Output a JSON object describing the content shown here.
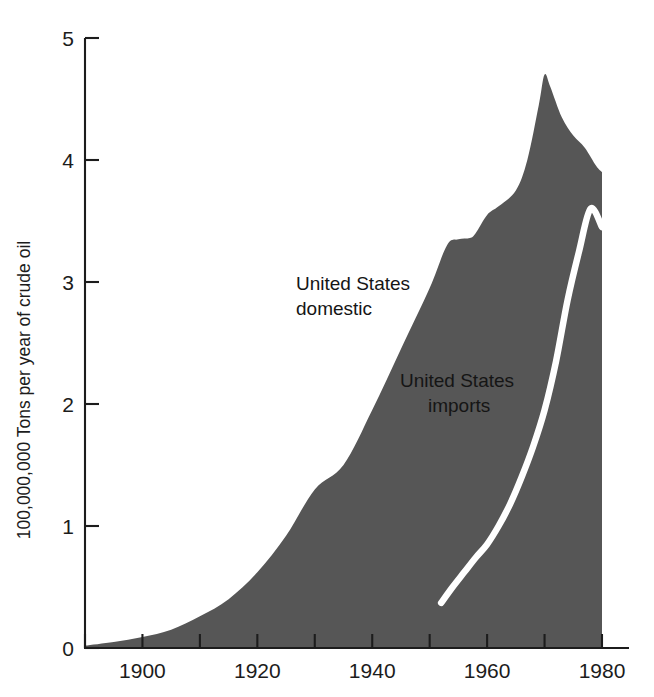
{
  "chart_data": {
    "type": "area",
    "title": "",
    "subtitle": "",
    "xlabel": "",
    "ylabel": "100,000,000 Tons per year of crude oil",
    "xlim": [
      1890,
      1980
    ],
    "ylim": [
      0,
      5
    ],
    "grid": false,
    "legend_position": "inline-annotations",
    "x_ticks_major": [
      1900,
      1920,
      1940,
      1960,
      1980
    ],
    "x_ticks_minor": [
      1890,
      1910,
      1930,
      1950,
      1970
    ],
    "x_tick_labels": [
      "1900",
      "1920",
      "1940",
      "1960",
      "1980"
    ],
    "y_ticks": [
      0,
      1,
      2,
      3,
      4,
      5
    ],
    "y_tick_labels": [
      "0",
      "1",
      "2",
      "3",
      "4",
      "5"
    ],
    "units_note": "100,000,000 Tons per year of crude oil",
    "series": [
      {
        "name": "United States domestic",
        "kind": "area",
        "fill_color": "#565656",
        "label_lines": [
          "United States",
          "domestic"
        ],
        "label_color": "#151515",
        "x": [
          1890,
          1895,
          1900,
          1905,
          1910,
          1915,
          1920,
          1925,
          1930,
          1935,
          1940,
          1945,
          1950,
          1953,
          1955,
          1957,
          1958,
          1960,
          1962,
          1965,
          1967,
          1969,
          1970,
          1971,
          1973,
          1975,
          1977,
          1979,
          1980
        ],
        "values": [
          0.02,
          0.05,
          0.09,
          0.15,
          0.26,
          0.4,
          0.62,
          0.92,
          1.3,
          1.5,
          1.95,
          2.45,
          2.95,
          3.3,
          3.35,
          3.36,
          3.4,
          3.55,
          3.62,
          3.75,
          4.0,
          4.45,
          4.7,
          4.6,
          4.35,
          4.2,
          4.1,
          3.95,
          3.9
        ]
      },
      {
        "name": "United States imports",
        "kind": "line",
        "line_color": "#ffffff",
        "label_lines": [
          "United States",
          "imports"
        ],
        "label_color": "#151515",
        "x": [
          1952,
          1954,
          1956,
          1958,
          1960,
          1962,
          1964,
          1966,
          1968,
          1970,
          1972,
          1974,
          1976,
          1978,
          1980
        ],
        "values": [
          0.37,
          0.5,
          0.62,
          0.74,
          0.85,
          1.0,
          1.18,
          1.4,
          1.65,
          1.95,
          2.35,
          2.85,
          3.25,
          3.6,
          3.45
        ]
      }
    ]
  },
  "annotations": {
    "domestic": {
      "line1": "United States",
      "line2": "domestic"
    },
    "imports": {
      "line1": "United States",
      "line2": "imports"
    }
  },
  "axis": {
    "y_label": "100,000,000 Tons per year of crude oil",
    "y_ticks": [
      "5",
      "4",
      "3",
      "2",
      "1",
      "0"
    ],
    "x_ticks": [
      "1900",
      "1920",
      "1940",
      "1960",
      "1980"
    ]
  },
  "colors": {
    "area_fill": "#565656",
    "imports_line": "#ffffff",
    "axis": "#1c1c1c",
    "background": "#ffffff",
    "text": "#1c1c1c"
  }
}
